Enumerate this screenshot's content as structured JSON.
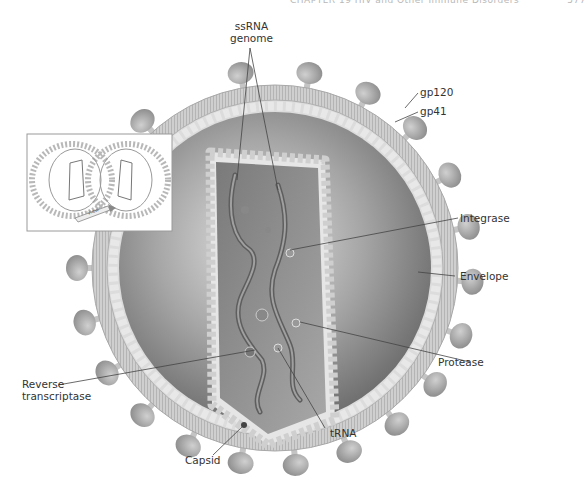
{
  "header": {
    "running_head": "CHAPTER 19   HIV and Other Immune Disorders",
    "page_number": "577"
  },
  "figure": {
    "labels": {
      "ssrna_line1": "ssRNA",
      "ssrna_line2": "genome",
      "gp120": "gp120",
      "gp41": "gp41",
      "integrase": "Integrase",
      "envelope": "Envelope",
      "protease": "Protease",
      "reverse_line1": "Reverse",
      "reverse_line2": "transcriptase",
      "trna": "tRNA",
      "capsid": "Capsid"
    },
    "inset": {
      "view_label": "View"
    },
    "colors": {
      "envelope": "#c9c9c9",
      "matrix": "#d8d8d8",
      "interior": "#8a8a8a",
      "capsid": "#e4e4e4",
      "spike": "#a9a9a9",
      "label_text": "#333333",
      "leader_line": "#444444"
    }
  }
}
